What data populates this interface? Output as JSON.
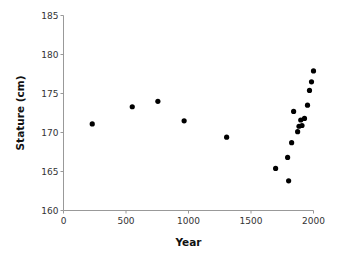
{
  "chart_data": {
    "type": "scatter",
    "title": "",
    "xlabel": "Year",
    "ylabel": "Stature (cm)",
    "xlim": [
      0,
      2000
    ],
    "ylim": [
      160,
      185
    ],
    "x_ticks": [
      0,
      500,
      1000,
      1500,
      2000
    ],
    "y_ticks": [
      160,
      165,
      170,
      175,
      180,
      185
    ],
    "grid": false,
    "legend": null,
    "marker_color": "#000000",
    "axis_color": "#999999",
    "series": [
      {
        "name": "Stature",
        "points": [
          {
            "x": 230,
            "y": 171.1
          },
          {
            "x": 550,
            "y": 173.3
          },
          {
            "x": 755,
            "y": 174.0
          },
          {
            "x": 965,
            "y": 171.5
          },
          {
            "x": 1305,
            "y": 169.4
          },
          {
            "x": 1697,
            "y": 165.4
          },
          {
            "x": 1793,
            "y": 166.8
          },
          {
            "x": 1801,
            "y": 163.8
          },
          {
            "x": 1825,
            "y": 168.7
          },
          {
            "x": 1841,
            "y": 172.7
          },
          {
            "x": 1873,
            "y": 170.1
          },
          {
            "x": 1884,
            "y": 170.8
          },
          {
            "x": 1898,
            "y": 171.6
          },
          {
            "x": 1908,
            "y": 170.9
          },
          {
            "x": 1928,
            "y": 171.8
          },
          {
            "x": 1952,
            "y": 173.5
          },
          {
            "x": 1968,
            "y": 175.4
          },
          {
            "x": 1984,
            "y": 176.5
          },
          {
            "x": 2000,
            "y": 177.9
          }
        ]
      }
    ]
  }
}
